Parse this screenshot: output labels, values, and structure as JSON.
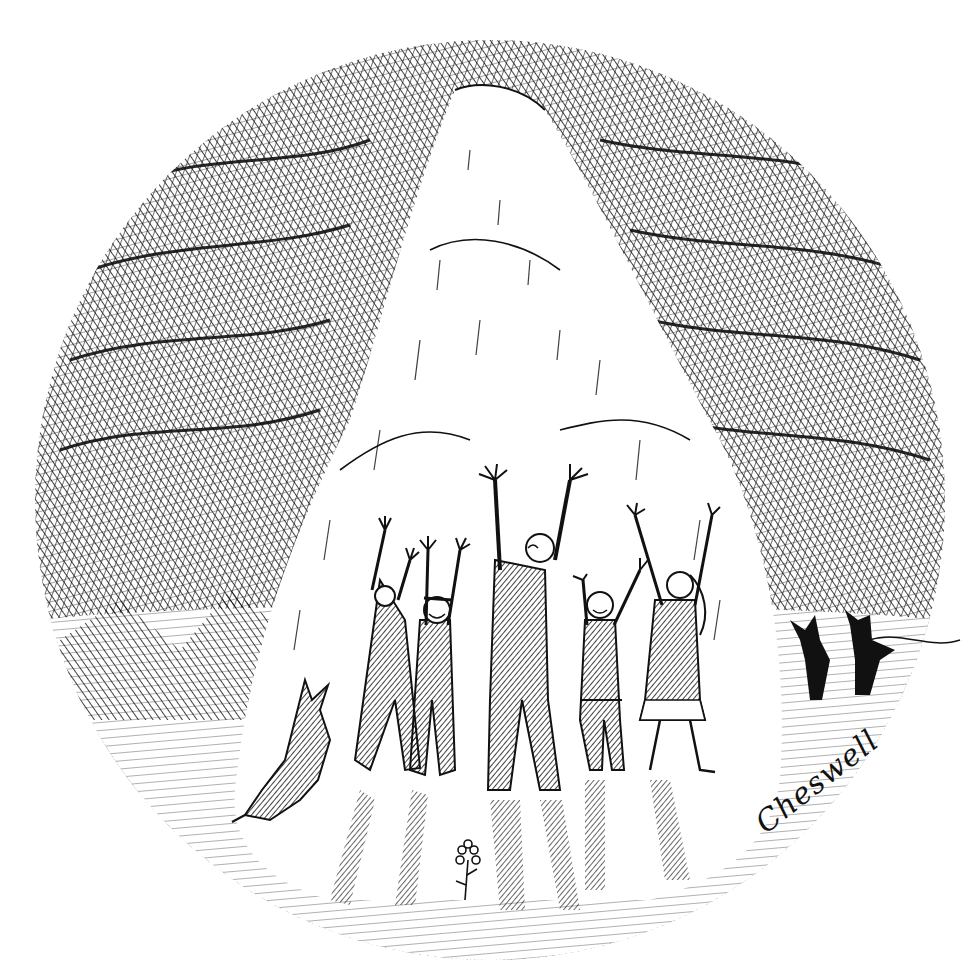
{
  "illustration": {
    "caption": "Pen-and-ink drawing of figures raising their arms toward a glowing mountain",
    "style": "black ink cross-hatching on white",
    "colors": {
      "ink": "#111111",
      "paper": "#ffffff"
    },
    "signature": "Cheswell",
    "elements": {
      "sky": "dark cross-hatched clouds framing a circular vignette",
      "mountain": "bright white peak with radiating light beam",
      "figures": [
        {
          "id": "figure-1",
          "description": "tall figure in dark coat, arms raised"
        },
        {
          "id": "figure-2",
          "description": "smiling child with cap, arms raised"
        },
        {
          "id": "figure-3",
          "description": "tall central figure, head tilted up, arms raised wide"
        },
        {
          "id": "figure-4",
          "description": "small smiling child in shorts, arms raised"
        },
        {
          "id": "figure-5",
          "description": "woman with long hair and skirt, arms raised"
        }
      ],
      "animal": "dog standing on hind legs at lower left",
      "distant_figures": "two dark silhouettes at right edge",
      "flower": "small five-petal flower at bottom center"
    }
  }
}
